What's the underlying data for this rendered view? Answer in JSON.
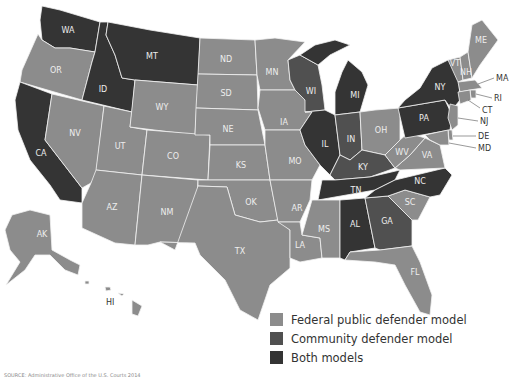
{
  "colors": {
    "federal": "#8c8c8c",
    "community": "#505050",
    "both": "#343434",
    "border": "#f2f2f2"
  },
  "legend": {
    "items": [
      {
        "key": "federal",
        "label": "Federal public defender model"
      },
      {
        "key": "community",
        "label": "Community defender model"
      },
      {
        "key": "both",
        "label": "Both models"
      }
    ]
  },
  "source": "SOURCE: Administrative Office of the U.S. Courts 2014",
  "states": {
    "WA": "both",
    "OR": "federal",
    "CA": "both",
    "ID": "both",
    "MT": "both",
    "NV": "federal",
    "UT": "federal",
    "AZ": "federal",
    "WY": "federal",
    "CO": "federal",
    "NM": "federal",
    "ND": "federal",
    "SD": "federal",
    "NE": "federal",
    "KS": "federal",
    "OK": "federal",
    "TX": "federal",
    "MN": "federal",
    "IA": "federal",
    "MO": "federal",
    "AR": "federal",
    "LA": "federal",
    "WI": "community",
    "IL": "both",
    "MI": "both",
    "IN": "community",
    "OH": "federal",
    "KY": "community",
    "TN": "both",
    "MS": "federal",
    "AL": "both",
    "GA": "community",
    "FL": "federal",
    "SC": "federal",
    "NC": "both",
    "VA": "federal",
    "WV": "federal",
    "PA": "both",
    "NY": "both",
    "VT": "federal",
    "NH": "federal",
    "ME": "federal",
    "MA": "federal",
    "RI": "federal",
    "CT": "federal",
    "NJ": "federal",
    "DE": "federal",
    "MD": "federal",
    "AK": "federal",
    "HI": "federal"
  },
  "labels": {
    "WA": "WA",
    "OR": "OR",
    "CA": "CA",
    "ID": "ID",
    "MT": "MT",
    "NV": "NV",
    "UT": "UT",
    "AZ": "AZ",
    "WY": "WY",
    "CO": "CO",
    "NM": "NM",
    "ND": "ND",
    "SD": "SD",
    "NE": "NE",
    "KS": "KS",
    "OK": "OK",
    "TX": "TX",
    "MN": "MN",
    "IA": "IA",
    "MO": "MO",
    "AR": "AR",
    "LA": "LA",
    "WI": "WI",
    "IL": "IL",
    "MI": "MI",
    "IN": "IN",
    "OH": "OH",
    "KY": "KY",
    "TN": "TN",
    "MS": "MS",
    "AL": "AL",
    "GA": "GA",
    "FL": "FL",
    "SC": "SC",
    "NC": "NC",
    "VA": "VA",
    "WV": "WV",
    "PA": "PA",
    "NY": "NY",
    "VT": "VT",
    "NH": "NH",
    "ME": "ME",
    "MA": "MA",
    "RI": "RI",
    "CT": "CT",
    "NJ": "NJ",
    "DE": "DE",
    "MD": "MD",
    "AK": "AK",
    "HI": "HI"
  }
}
